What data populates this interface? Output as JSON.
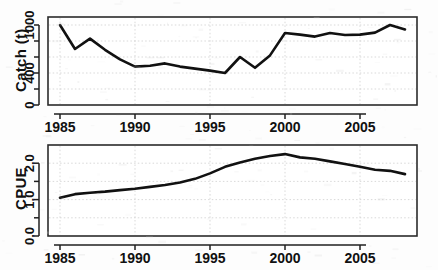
{
  "figure": {
    "kind": "two-panel-time-series",
    "background": "#fdfdfd",
    "line_color": "#111111",
    "grid_color": "#c9c9c9"
  },
  "panels": {
    "catch": {
      "ylabel": "Catch (t)",
      "ytick_labels": [
        "0",
        "400",
        "1000"
      ],
      "xtick_labels": [
        "1985",
        "1990",
        "1995",
        "2000",
        "2005"
      ]
    },
    "cpue": {
      "ylabel": "CPUE",
      "ytick_labels": [
        "0.0",
        "1.0",
        "2.0"
      ],
      "xtick_labels": [
        "1985",
        "1990",
        "1995",
        "2000",
        "2005"
      ]
    }
  },
  "chart_data": [
    {
      "type": "line",
      "title": "",
      "xlabel": "",
      "ylabel": "Catch (t)",
      "xlim": [
        1984.2,
        2008.8
      ],
      "ylim": [
        0,
        1100
      ],
      "xticks": [
        1985,
        1990,
        1995,
        2000,
        2005
      ],
      "xtick_labels": [
        "1985",
        "1990",
        "1995",
        "2000",
        "2005"
      ],
      "yticks": [
        0,
        200,
        400,
        600,
        800,
        1000
      ],
      "ytick_labels": [
        "0",
        "",
        "400",
        "",
        "",
        "1000"
      ],
      "grid": true,
      "legend": "none",
      "x": [
        1985,
        1986,
        1987,
        1988,
        1989,
        1990,
        1991,
        1992,
        1993,
        1994,
        1995,
        1996,
        1997,
        1998,
        1999,
        2000,
        2001,
        2002,
        2003,
        2004,
        2005,
        2006,
        2007,
        2008
      ],
      "values": [
        1000,
        700,
        830,
        690,
        570,
        480,
        490,
        520,
        480,
        455,
        430,
        400,
        600,
        465,
        620,
        900,
        880,
        855,
        900,
        875,
        880,
        905,
        1000,
        945
      ]
    },
    {
      "type": "line",
      "title": "",
      "xlabel": "",
      "ylabel": "CPUE",
      "xlim": [
        1984.2,
        2008.8
      ],
      "ylim": [
        0,
        2.5
      ],
      "xticks": [
        1985,
        1990,
        1995,
        2000,
        2005
      ],
      "xtick_labels": [
        "1985",
        "1990",
        "1995",
        "2000",
        "2005"
      ],
      "yticks": [
        0.0,
        0.5,
        1.0,
        1.5,
        2.0
      ],
      "ytick_labels": [
        "0.0",
        "",
        "1.0",
        "",
        "2.0"
      ],
      "grid": true,
      "legend": "none",
      "x": [
        1985,
        1986,
        1987,
        1988,
        1989,
        1990,
        1991,
        1992,
        1993,
        1994,
        1995,
        1996,
        1997,
        1998,
        1999,
        2000,
        2001,
        2002,
        2003,
        2004,
        2005,
        2006,
        2007,
        2008
      ],
      "values": [
        1.05,
        1.15,
        1.19,
        1.22,
        1.26,
        1.3,
        1.35,
        1.4,
        1.47,
        1.57,
        1.72,
        1.9,
        2.02,
        2.12,
        2.2,
        2.25,
        2.16,
        2.12,
        2.05,
        1.98,
        1.9,
        1.82,
        1.79,
        1.7
      ]
    }
  ]
}
